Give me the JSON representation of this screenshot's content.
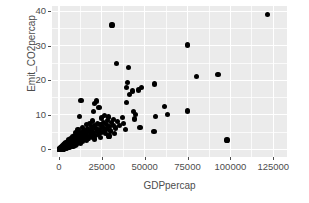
{
  "chart_data": {
    "type": "scatter",
    "title": "",
    "xlabel": "GDPpercap",
    "ylabel": "Emit_CO2percap",
    "xlim": [
      -4000,
      133000
    ],
    "ylim": [
      -2.2,
      41.5
    ],
    "xticks": [
      0,
      25000,
      50000,
      75000,
      100000,
      125000
    ],
    "xtick_labels": [
      "0",
      "25000",
      "50000",
      "75000",
      "100000",
      "125000"
    ],
    "yticks": [
      0,
      10,
      20,
      30,
      40
    ],
    "ytick_labels": [
      "0",
      "10",
      "20",
      "30",
      "40"
    ],
    "x_minor_ticks": [
      12500,
      37500,
      62500,
      87500,
      112500
    ],
    "y_minor_ticks": [
      5,
      15,
      25,
      35
    ],
    "grid": true,
    "legend": "none",
    "panel_background": "#ebebeb",
    "grid_color": "#ffffff",
    "point_color": "#000000",
    "text_color": "#4d4d4d",
    "point_size": 5.2,
    "n_points": 180,
    "points": [
      [
        121500,
        39.0
      ],
      [
        31000,
        36.0
      ],
      [
        75000,
        30.2
      ],
      [
        33800,
        24.8
      ],
      [
        40600,
        23.8
      ],
      [
        92800,
        21.6
      ],
      [
        80300,
        21.1
      ],
      [
        40000,
        19.3
      ],
      [
        55800,
        18.9
      ],
      [
        39200,
        17.9
      ],
      [
        48000,
        17.8
      ],
      [
        46200,
        17.2
      ],
      [
        42800,
        16.9
      ],
      [
        41000,
        15.9
      ],
      [
        12900,
        14.2
      ],
      [
        22100,
        14.0
      ],
      [
        39600,
        13.6
      ],
      [
        21000,
        13.2
      ],
      [
        61500,
        12.5
      ],
      [
        23400,
        12.1
      ],
      [
        74800,
        11.1
      ],
      [
        20400,
        11.0
      ],
      [
        43500,
        11.0
      ],
      [
        63500,
        10.1
      ],
      [
        44900,
        10.0
      ],
      [
        26800,
        9.9
      ],
      [
        56500,
        9.6
      ],
      [
        11800,
        9.5
      ],
      [
        29000,
        9.4
      ],
      [
        36900,
        9.3
      ],
      [
        24700,
        9.1
      ],
      [
        44200,
        8.8
      ],
      [
        32000,
        8.7
      ],
      [
        28500,
        8.4
      ],
      [
        19800,
        8.2
      ],
      [
        34200,
        8.1
      ],
      [
        30600,
        7.9
      ],
      [
        26000,
        7.7
      ],
      [
        17800,
        7.6
      ],
      [
        37500,
        7.5
      ],
      [
        22700,
        7.4
      ],
      [
        27600,
        7.3
      ],
      [
        24000,
        7.2
      ],
      [
        15900,
        7.1
      ],
      [
        31800,
        7.0
      ],
      [
        20800,
        6.9
      ],
      [
        35400,
        6.8
      ],
      [
        29600,
        6.7
      ],
      [
        18900,
        6.6
      ],
      [
        25500,
        6.5
      ],
      [
        47300,
        6.4
      ],
      [
        13600,
        6.3
      ],
      [
        33100,
        6.2
      ],
      [
        21600,
        6.1
      ],
      [
        16800,
        6.0
      ],
      [
        28000,
        5.9
      ],
      [
        23800,
        5.8
      ],
      [
        11200,
        5.7
      ],
      [
        38800,
        5.7
      ],
      [
        19200,
        5.6
      ],
      [
        26400,
        5.5
      ],
      [
        14700,
        5.4
      ],
      [
        30200,
        5.3
      ],
      [
        55500,
        5.1
      ],
      [
        22400,
        5.2
      ],
      [
        17200,
        5.1
      ],
      [
        9800,
        5.0
      ],
      [
        25000,
        4.9
      ],
      [
        12400,
        4.9
      ],
      [
        20100,
        4.8
      ],
      [
        32600,
        4.7
      ],
      [
        15200,
        4.6
      ],
      [
        27200,
        4.6
      ],
      [
        10600,
        4.5
      ],
      [
        18400,
        4.4
      ],
      [
        23000,
        4.3
      ],
      [
        13100,
        4.2
      ],
      [
        16300,
        4.1
      ],
      [
        8900,
        4.1
      ],
      [
        21200,
        4.0
      ],
      [
        29200,
        3.9
      ],
      [
        11600,
        3.8
      ],
      [
        14200,
        3.7
      ],
      [
        19600,
        3.6
      ],
      [
        7900,
        3.6
      ],
      [
        24400,
        3.5
      ],
      [
        9400,
        3.4
      ],
      [
        17000,
        3.3
      ],
      [
        12000,
        3.3
      ],
      [
        6800,
        3.2
      ],
      [
        15600,
        3.1
      ],
      [
        10200,
        3.0
      ],
      [
        20600,
        3.0
      ],
      [
        8100,
        2.9
      ],
      [
        13400,
        2.8
      ],
      [
        98000,
        2.7
      ],
      [
        5900,
        2.7
      ],
      [
        11000,
        2.6
      ],
      [
        16000,
        2.6
      ],
      [
        7200,
        2.5
      ],
      [
        9000,
        2.4
      ],
      [
        12600,
        2.4
      ],
      [
        4900,
        2.3
      ],
      [
        14000,
        2.2
      ],
      [
        6300,
        2.2
      ],
      [
        10000,
        2.1
      ],
      [
        8000,
        2.0
      ],
      [
        4200,
        2.0
      ],
      [
        11400,
        1.9
      ],
      [
        5500,
        1.9
      ],
      [
        7000,
        1.8
      ],
      [
        9200,
        1.8
      ],
      [
        3600,
        1.7
      ],
      [
        12800,
        1.7
      ],
      [
        6000,
        1.6
      ],
      [
        4600,
        1.6
      ],
      [
        8400,
        1.5
      ],
      [
        3100,
        1.5
      ],
      [
        10400,
        1.4
      ],
      [
        5200,
        1.4
      ],
      [
        6600,
        1.3
      ],
      [
        2700,
        1.3
      ],
      [
        7600,
        1.2
      ],
      [
        3900,
        1.2
      ],
      [
        4400,
        1.1
      ],
      [
        9600,
        1.1
      ],
      [
        2300,
        1.0
      ],
      [
        5800,
        1.0
      ],
      [
        3300,
        0.95
      ],
      [
        6900,
        0.9
      ],
      [
        1900,
        0.9
      ],
      [
        4100,
        0.85
      ],
      [
        2600,
        0.8
      ],
      [
        8200,
        0.8
      ],
      [
        5000,
        0.75
      ],
      [
        1600,
        0.7
      ],
      [
        3000,
        0.7
      ],
      [
        6200,
        0.65
      ],
      [
        2100,
        0.6
      ],
      [
        4700,
        0.6
      ],
      [
        1300,
        0.55
      ],
      [
        3500,
        0.5
      ],
      [
        2400,
        0.5
      ],
      [
        5400,
        0.45
      ],
      [
        1100,
        0.42
      ],
      [
        1800,
        0.4
      ],
      [
        3800,
        0.38
      ],
      [
        2900,
        0.35
      ],
      [
        900,
        0.33
      ],
      [
        1500,
        0.3
      ],
      [
        4300,
        0.3
      ],
      [
        2200,
        0.28
      ],
      [
        700,
        0.25
      ],
      [
        3200,
        0.24
      ],
      [
        1200,
        0.22
      ],
      [
        2600,
        0.2
      ],
      [
        1900,
        0.19
      ],
      [
        550,
        0.18
      ],
      [
        1000,
        0.16
      ],
      [
        3600,
        0.16
      ],
      [
        1400,
        0.14
      ],
      [
        2800,
        0.13
      ],
      [
        800,
        0.12
      ],
      [
        2000,
        0.11
      ],
      [
        450,
        0.1
      ],
      [
        1600,
        0.09
      ],
      [
        1150,
        0.08
      ],
      [
        2400,
        0.08
      ],
      [
        650,
        0.07
      ],
      [
        1800,
        0.06
      ],
      [
        350,
        0.05
      ],
      [
        1300,
        0.05
      ],
      [
        950,
        0.04
      ],
      [
        2100,
        0.04
      ],
      [
        500,
        0.03
      ],
      [
        1500,
        0.03
      ],
      [
        750,
        0.02
      ],
      [
        1100,
        0.02
      ],
      [
        300,
        0.015
      ],
      [
        1900,
        0.015
      ],
      [
        600,
        0.01
      ],
      [
        1350,
        0.01
      ],
      [
        850,
        0.008
      ],
      [
        250,
        0.005
      ],
      [
        1700,
        0.005
      ],
      [
        450,
        0.003
      ],
      [
        1050,
        0.002
      ]
    ]
  }
}
